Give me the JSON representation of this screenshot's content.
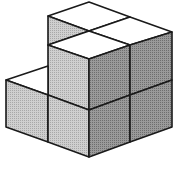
{
  "diagram": {
    "type": "isometric-cube-stack",
    "cube_count_visible_faces": {
      "top_faces": 4,
      "left_faces": 4,
      "right_faces": 4
    },
    "colors": {
      "top": "#ffffff",
      "left": "#c4c4c4",
      "right": "#8f8f8f",
      "edge": "#1a1a1a",
      "background": "#ffffff"
    }
  }
}
